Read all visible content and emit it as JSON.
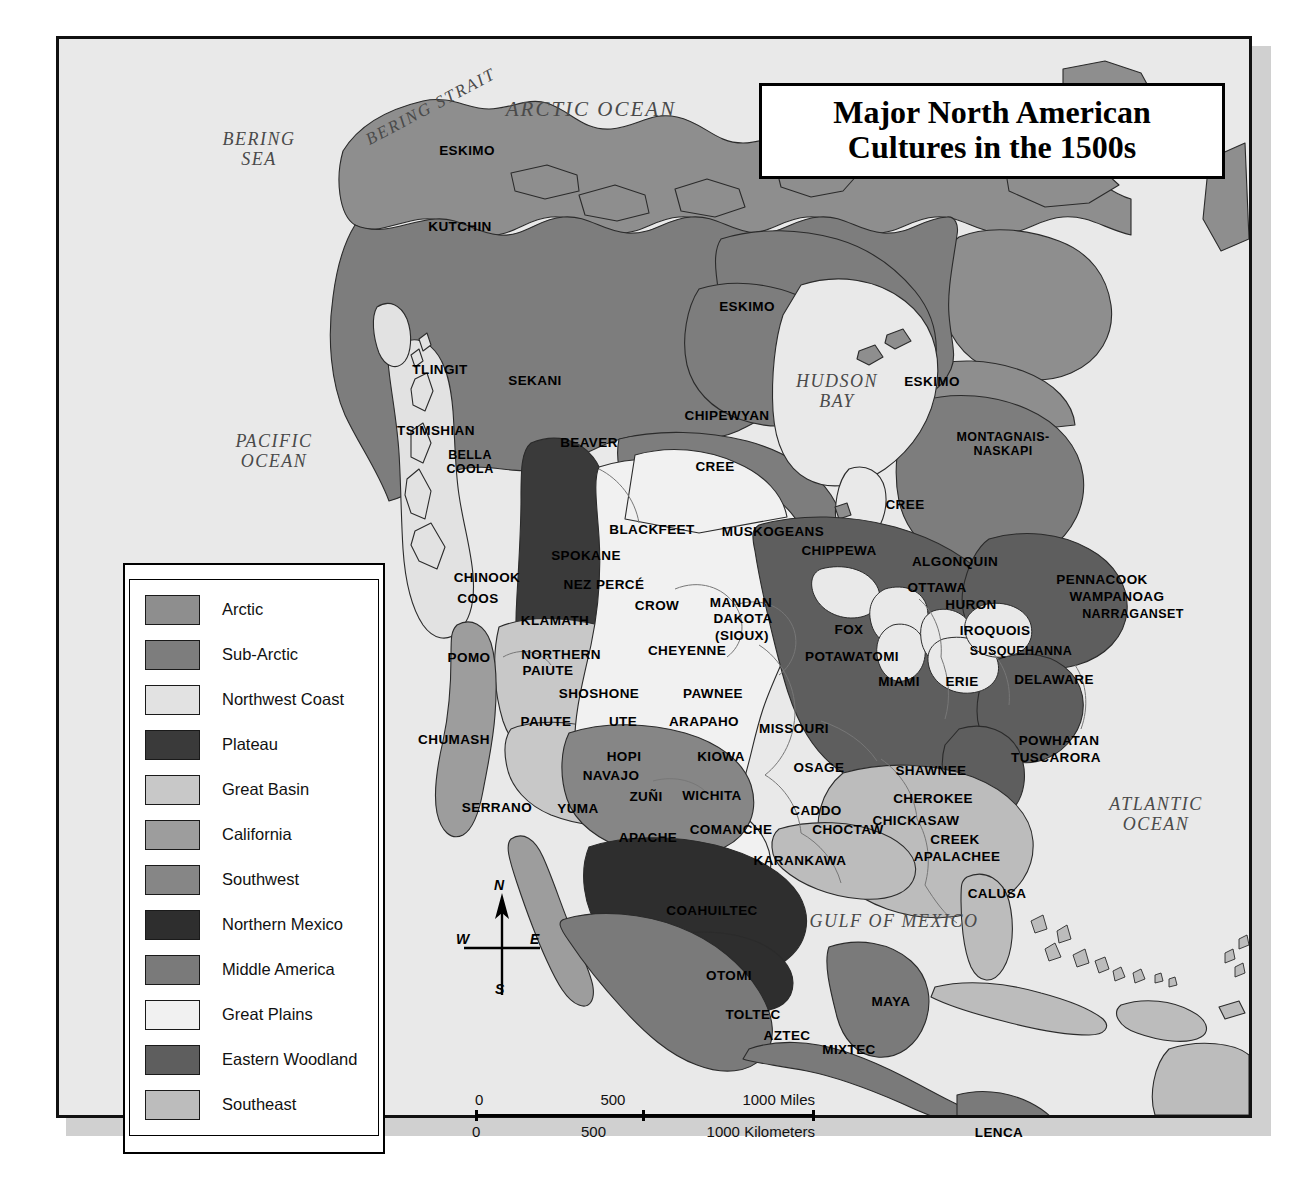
{
  "title": {
    "line1": "Major North American",
    "line2": "Cultures in the 1500s"
  },
  "legend": {
    "items": [
      {
        "label": "Arctic",
        "color": "#8e8e8e"
      },
      {
        "label": "Sub-Arctic",
        "color": "#7d7d7d"
      },
      {
        "label": "Northwest Coast",
        "color": "#e2e2e2"
      },
      {
        "label": "Plateau",
        "color": "#3a3a3a"
      },
      {
        "label": "Great Basin",
        "color": "#c8c8c8"
      },
      {
        "label": "California",
        "color": "#9d9d9d"
      },
      {
        "label": "Southwest",
        "color": "#868686"
      },
      {
        "label": "Northern Mexico",
        "color": "#2e2e2e"
      },
      {
        "label": "Middle America",
        "color": "#7a7a7a"
      },
      {
        "label": "Great Plains",
        "color": "#f1f1f1"
      },
      {
        "label": "Eastern Woodland",
        "color": "#5e5e5e"
      },
      {
        "label": "Southeast",
        "color": "#bcbcbc"
      }
    ]
  },
  "compass": {
    "n": "N",
    "e": "E",
    "s": "S",
    "w": "W"
  },
  "scale": {
    "miles": {
      "zero": "0",
      "mid": "500",
      "end": "1000 Miles"
    },
    "kilometers": {
      "zero": "0",
      "mid": "500",
      "end": "1000 Kilometers"
    }
  },
  "water_labels": [
    {
      "name": "bering-sea",
      "text": "BERING\nSEA",
      "x": 200,
      "y": 110,
      "size": "sm"
    },
    {
      "name": "bering-strait",
      "text": "BERING STRAIT",
      "x": 372,
      "y": 68,
      "size": "strait"
    },
    {
      "name": "arctic-ocean",
      "text": "ARCTIC OCEAN",
      "x": 532,
      "y": 71,
      "size": ""
    },
    {
      "name": "pacific-ocean",
      "text": "PACIFIC\nOCEAN",
      "x": 215,
      "y": 412,
      "size": "sm"
    },
    {
      "name": "hudson-bay",
      "text": "HUDSON\nBAY",
      "x": 778,
      "y": 352,
      "size": "sm"
    },
    {
      "name": "atlantic-ocean",
      "text": "ATLANTIC\nOCEAN",
      "x": 1097,
      "y": 775,
      "size": "sm"
    },
    {
      "name": "gulf-of-mexico",
      "text": "GULF OF MEXICO",
      "x": 835,
      "y": 882,
      "size": "sm"
    }
  ],
  "culture_labels": [
    {
      "text": "ESKIMO",
      "x": 408,
      "y": 112
    },
    {
      "text": "KUTCHIN",
      "x": 401,
      "y": 188
    },
    {
      "text": "ESKIMO",
      "x": 688,
      "y": 268
    },
    {
      "text": "ESKIMO",
      "x": 873,
      "y": 343
    },
    {
      "text": "TLINGIT",
      "x": 381,
      "y": 331
    },
    {
      "text": "SEKANI",
      "x": 476,
      "y": 342
    },
    {
      "text": "CHIPEWYAN",
      "x": 668,
      "y": 377
    },
    {
      "text": "MONTAGNAIS-\nNASKAPI",
      "x": 944,
      "y": 405
    },
    {
      "text": "TSIMSHIAN",
      "x": 377,
      "y": 392
    },
    {
      "text": "BEAVER",
      "x": 530,
      "y": 404
    },
    {
      "text": "BELLA\nCOOLA",
      "x": 411,
      "y": 423
    },
    {
      "text": "CREE",
      "x": 656,
      "y": 428
    },
    {
      "text": "CREE",
      "x": 846,
      "y": 466
    },
    {
      "text": "BLACKFEET",
      "x": 593,
      "y": 491
    },
    {
      "text": "MUSKOGEANS",
      "x": 714,
      "y": 493
    },
    {
      "text": "CHIPPEWA",
      "x": 780,
      "y": 512
    },
    {
      "text": "ALGONQUIN",
      "x": 896,
      "y": 523
    },
    {
      "text": "PENNACOOK",
      "x": 1043,
      "y": 541
    },
    {
      "text": "SPOKANE",
      "x": 527,
      "y": 517
    },
    {
      "text": "CHINOOK",
      "x": 428,
      "y": 539
    },
    {
      "text": "NEZ PERCÉ",
      "x": 545,
      "y": 546
    },
    {
      "text": "OTTAWA",
      "x": 878,
      "y": 549
    },
    {
      "text": "WAMPANOAG",
      "x": 1058,
      "y": 558
    },
    {
      "text": "COOS",
      "x": 419,
      "y": 560
    },
    {
      "text": "CROW",
      "x": 598,
      "y": 567
    },
    {
      "text": "MANDAN",
      "x": 682,
      "y": 564
    },
    {
      "text": "HURON",
      "x": 912,
      "y": 566
    },
    {
      "text": "NARRAGANSET",
      "x": 1074,
      "y": 576
    },
    {
      "text": "KLAMATH",
      "x": 496,
      "y": 582
    },
    {
      "text": "DAKOTA",
      "x": 684,
      "y": 580
    },
    {
      "text": "(SIOUX)",
      "x": 683,
      "y": 597
    },
    {
      "text": "FOX",
      "x": 790,
      "y": 591
    },
    {
      "text": "IROQUOIS",
      "x": 936,
      "y": 592
    },
    {
      "text": "POMO",
      "x": 410,
      "y": 619
    },
    {
      "text": "NORTHERN",
      "x": 502,
      "y": 616
    },
    {
      "text": "PAIUTE",
      "x": 489,
      "y": 632
    },
    {
      "text": "CHEYENNE",
      "x": 628,
      "y": 612
    },
    {
      "text": "POTAWATOMI",
      "x": 793,
      "y": 618
    },
    {
      "text": "SUSQUEHANNA",
      "x": 962,
      "y": 613
    },
    {
      "text": "SHOSHONE",
      "x": 540,
      "y": 655
    },
    {
      "text": "MIAMI",
      "x": 840,
      "y": 643
    },
    {
      "text": "ERIE",
      "x": 903,
      "y": 643
    },
    {
      "text": "DELAWARE",
      "x": 995,
      "y": 641
    },
    {
      "text": "PAIUTE",
      "x": 487,
      "y": 683
    },
    {
      "text": "UTE",
      "x": 564,
      "y": 683
    },
    {
      "text": "PAWNEE",
      "x": 654,
      "y": 655
    },
    {
      "text": "ARAPAHO",
      "x": 645,
      "y": 683
    },
    {
      "text": "MISSOURI",
      "x": 735,
      "y": 690
    },
    {
      "text": "CHUMASH",
      "x": 395,
      "y": 701
    },
    {
      "text": "POWHATAN",
      "x": 1000,
      "y": 702
    },
    {
      "text": "TUSCARORA",
      "x": 997,
      "y": 719
    },
    {
      "text": "HOPI",
      "x": 565,
      "y": 718
    },
    {
      "text": "KIOWA",
      "x": 662,
      "y": 718
    },
    {
      "text": "OSAGE",
      "x": 760,
      "y": 729
    },
    {
      "text": "SHAWNEE",
      "x": 872,
      "y": 732
    },
    {
      "text": "NAVAJO",
      "x": 552,
      "y": 737
    },
    {
      "text": "CHEROKEE",
      "x": 874,
      "y": 760
    },
    {
      "text": "ZUÑI",
      "x": 587,
      "y": 758
    },
    {
      "text": "WICHITA",
      "x": 653,
      "y": 757
    },
    {
      "text": "CHICKASAW",
      "x": 857,
      "y": 782
    },
    {
      "text": "SERRANO",
      "x": 438,
      "y": 769
    },
    {
      "text": "YUMA",
      "x": 519,
      "y": 770
    },
    {
      "text": "CADDO",
      "x": 757,
      "y": 772
    },
    {
      "text": "CREEK",
      "x": 896,
      "y": 801
    },
    {
      "text": "APACHE",
      "x": 589,
      "y": 799
    },
    {
      "text": "COMANCHE",
      "x": 672,
      "y": 791
    },
    {
      "text": "CHOCTAW",
      "x": 789,
      "y": 791
    },
    {
      "text": "APALACHEE",
      "x": 898,
      "y": 818
    },
    {
      "text": "CALUSA",
      "x": 938,
      "y": 855
    },
    {
      "text": "KARANKAWA",
      "x": 741,
      "y": 822
    },
    {
      "text": "COAHUILTEC",
      "x": 653,
      "y": 872
    },
    {
      "text": "OTOMI",
      "x": 670,
      "y": 937
    },
    {
      "text": "MAYA",
      "x": 832,
      "y": 963
    },
    {
      "text": "TOLTEC",
      "x": 694,
      "y": 976
    },
    {
      "text": "AZTEC",
      "x": 728,
      "y": 997
    },
    {
      "text": "MIXTEC",
      "x": 790,
      "y": 1011
    },
    {
      "text": "LENCA",
      "x": 940,
      "y": 1094
    }
  ]
}
